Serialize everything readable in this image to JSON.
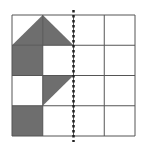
{
  "diagram": {
    "title": "",
    "grid": {
      "rows": 4,
      "cols": 4
    },
    "line_color": "#555555",
    "fill_color": "#6e6e6e",
    "axis_color": "#222222",
    "symmetry_axis": {
      "style": "dotted",
      "at_column_boundary": 2
    },
    "shapes": [
      {
        "name": "triangle-top-left",
        "type": "polygon",
        "points": [
          [
            0,
            1
          ],
          [
            1,
            0
          ],
          [
            1,
            1
          ]
        ]
      },
      {
        "name": "triangle-top-right",
        "type": "polygon",
        "points": [
          [
            1,
            0
          ],
          [
            2,
            1
          ],
          [
            1,
            1
          ]
        ]
      },
      {
        "name": "square-row2-col1",
        "type": "polygon",
        "points": [
          [
            0,
            1
          ],
          [
            1,
            1
          ],
          [
            1,
            2
          ],
          [
            0,
            2
          ]
        ]
      },
      {
        "name": "triangle-row3-col2",
        "type": "polygon",
        "points": [
          [
            1,
            2
          ],
          [
            2,
            2
          ],
          [
            1,
            3
          ]
        ]
      },
      {
        "name": "square-row4-col1",
        "type": "polygon",
        "points": [
          [
            0,
            3
          ],
          [
            1,
            3
          ],
          [
            1,
            4
          ],
          [
            0,
            4
          ]
        ]
      }
    ]
  }
}
